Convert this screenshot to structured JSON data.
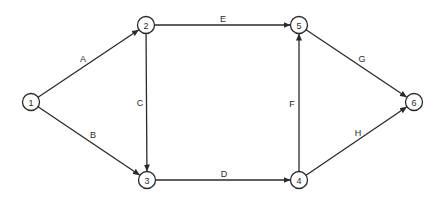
{
  "diagram": {
    "type": "activity-on-arrow network",
    "colors": {
      "line": "#2a2a2a",
      "background": "#ffffff"
    },
    "nodes": [
      {
        "id": "1",
        "label": "1",
        "x": 31,
        "y": 102
      },
      {
        "id": "2",
        "label": "2",
        "x": 146,
        "y": 25
      },
      {
        "id": "3",
        "label": "3",
        "x": 147,
        "y": 180
      },
      {
        "id": "4",
        "label": "4",
        "x": 299,
        "y": 180
      },
      {
        "id": "5",
        "label": "5",
        "x": 299,
        "y": 25
      },
      {
        "id": "6",
        "label": "6",
        "x": 414,
        "y": 102
      }
    ],
    "edges": [
      {
        "id": "A",
        "label": "A",
        "from": "1",
        "to": "2",
        "label_x": 83,
        "label_y": 59
      },
      {
        "id": "B",
        "label": "B",
        "from": "1",
        "to": "3",
        "label_x": 93,
        "label_y": 135
      },
      {
        "id": "C",
        "label": "C",
        "from": "2",
        "to": "3",
        "label_x": 140,
        "label_y": 103
      },
      {
        "id": "D",
        "label": "D",
        "from": "3",
        "to": "4",
        "label_x": 224,
        "label_y": 174
      },
      {
        "id": "E",
        "label": "E",
        "from": "2",
        "to": "5",
        "label_x": 223,
        "label_y": 19
      },
      {
        "id": "F",
        "label": "F",
        "from": "4",
        "to": "5",
        "label_x": 292,
        "label_y": 104
      },
      {
        "id": "G",
        "label": "G",
        "from": "5",
        "to": "6",
        "label_x": 362,
        "label_y": 59
      },
      {
        "id": "H",
        "label": "H",
        "from": "4",
        "to": "6",
        "label_x": 358,
        "label_y": 133
      }
    ]
  }
}
